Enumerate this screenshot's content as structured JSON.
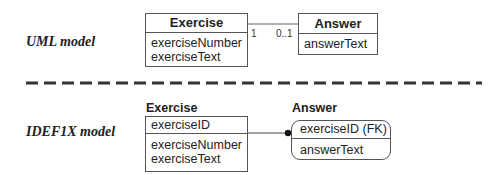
{
  "uml": {
    "label": "UML model",
    "exercise": {
      "name": "Exercise",
      "attributes": [
        "exerciseNumber",
        "exerciseText"
      ]
    },
    "answer": {
      "name": "Answer",
      "attributes": [
        "answerText"
      ]
    },
    "association": {
      "exercise_end_multiplicity": "1",
      "answer_end_multiplicity": "0..1"
    }
  },
  "idef1x": {
    "label": "IDEF1X model",
    "exercise": {
      "name": "Exercise",
      "key_attributes": [
        "exerciseID"
      ],
      "attributes": [
        "exerciseNumber",
        "exerciseText"
      ]
    },
    "answer": {
      "name": "Answer",
      "key_attributes": [
        "exerciseID (FK)"
      ],
      "attributes": [
        "answerText"
      ]
    }
  },
  "colors": {
    "line": "#555555",
    "separator": "#333333",
    "text": "#222222"
  }
}
